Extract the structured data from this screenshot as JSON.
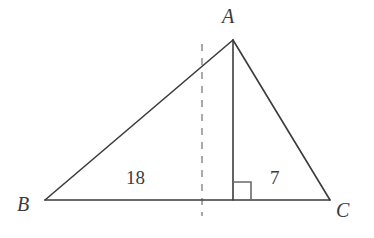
{
  "figure": {
    "kind": "geometry-diagram",
    "background_color": "#ffffff",
    "stroke_color": "#3b3b3b",
    "dashed_stroke_color": "#aaaaaa",
    "label_color": "#3b3b3b"
  },
  "vertices": [
    {
      "id": "A",
      "label": "A",
      "x": 233,
      "y": 40
    },
    {
      "id": "B",
      "label": "B",
      "x": 45,
      "y": 200
    },
    {
      "id": "C",
      "label": "C",
      "x": 330,
      "y": 200
    }
  ],
  "segments": [
    {
      "name": "side-BA",
      "from": "B",
      "to": "A",
      "style": "solid"
    },
    {
      "name": "side-AC",
      "from": "A",
      "to": "C",
      "style": "solid"
    },
    {
      "name": "side-BC",
      "from": "B",
      "to": "C",
      "style": "solid"
    },
    {
      "name": "altitude-AD",
      "from": "A",
      "to": "D",
      "style": "solid"
    }
  ],
  "foot_of_altitude": {
    "id": "D",
    "x": 233,
    "y": 200
  },
  "dashed_line": {
    "name": "dashed-reference-line",
    "x": 202,
    "y_top": 44,
    "y_bottom": 216,
    "dash": "7 7"
  },
  "right_angle_mark": {
    "name": "right-angle-mark",
    "x": 233,
    "y": 182,
    "size": 18,
    "orientation": "opens-right-up-from-foot"
  },
  "measurements": [
    {
      "name": "segment-BD-length",
      "value": "18",
      "x": 138,
      "y": 180,
      "segment": "B to D"
    },
    {
      "name": "segment-DC-length",
      "value": "7",
      "x": 277,
      "y": 180,
      "segment": "D to C"
    }
  ],
  "labels": {
    "A": "A",
    "B": "B",
    "C": "C",
    "length_left": "18",
    "length_right": "7"
  }
}
